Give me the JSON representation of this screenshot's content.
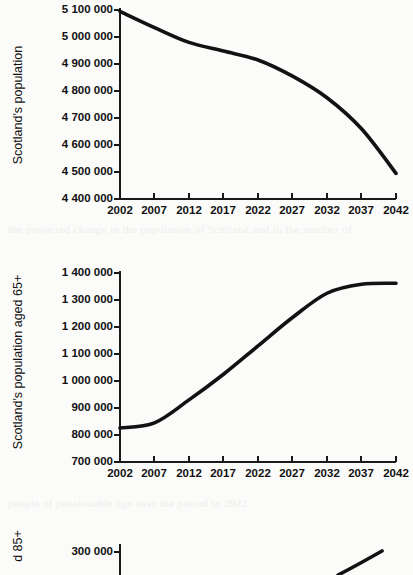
{
  "page": {
    "background_color": "#fbfbfa",
    "ink_color": "#121212",
    "bleed_through_line_1": "the projected change in the population of Scotland and in the number of",
    "bleed_through_line_2": "people of pensionable age over the period to 2042"
  },
  "chart_data": [
    {
      "id": "chart-total-population",
      "type": "line",
      "title": "",
      "xlabel": "",
      "ylabel": "Scotland's population",
      "x": [
        2002,
        2007,
        2012,
        2017,
        2022,
        2027,
        2032,
        2037,
        2042
      ],
      "xtick_labels": [
        "2002",
        "2007",
        "2012",
        "2017",
        "2022",
        "2027",
        "2032",
        "2037",
        "2042"
      ],
      "xlim": [
        2002,
        2042
      ],
      "ytick_labels": [
        "5 100 000",
        "5 000 000",
        "4 900 000",
        "4 800 000",
        "4 700 000",
        "4 600 000",
        "4 500 000",
        "4 400 000"
      ],
      "yticks": [
        5100000,
        5000000,
        4900000,
        4800000,
        4700000,
        4600000,
        4500000,
        4400000
      ],
      "ylim": [
        4400000,
        5100000
      ],
      "grid": false,
      "legend": "none",
      "series": [
        {
          "name": "Scotland's population",
          "values": [
            5095000,
            5035000,
            4980000,
            4948000,
            4915000,
            4855000,
            4775000,
            4660000,
            4495000
          ]
        }
      ]
    },
    {
      "id": "chart-population-65-plus",
      "type": "line",
      "title": "",
      "xlabel": "",
      "ylabel": "Scotland's population aged 65+",
      "x": [
        2002,
        2007,
        2012,
        2017,
        2022,
        2027,
        2032,
        2037,
        2042
      ],
      "xtick_labels": [
        "2002",
        "2007",
        "2012",
        "2017",
        "2022",
        "2027",
        "2032",
        "2037",
        "2042"
      ],
      "xlim": [
        2002,
        2042
      ],
      "ytick_labels": [
        "1 400 000",
        "1 300 000",
        "1 200 000",
        "1 100 000",
        "1 000 000",
        "900 000",
        "800 000",
        "700 000"
      ],
      "yticks": [
        1400000,
        1300000,
        1200000,
        1100000,
        1000000,
        900000,
        800000,
        700000
      ],
      "ylim": [
        700000,
        1400000
      ],
      "grid": false,
      "legend": "none",
      "series": [
        {
          "name": "Scotland's population aged 65+",
          "values": [
            826000,
            845000,
            930000,
            1025000,
            1130000,
            1235000,
            1325000,
            1358000,
            1362000
          ]
        }
      ]
    },
    {
      "id": "chart-population-85-plus",
      "type": "line",
      "title": "",
      "xlabel": "",
      "ylabel": "d 85+",
      "ylabel_full_visible": "d 85+",
      "ytick_labels": [
        "300 000"
      ],
      "yticks": [
        300000
      ],
      "grid": false,
      "legend": "none",
      "cropped": true,
      "series": [
        {
          "name": "Scotland's population aged 85+",
          "values": []
        }
      ]
    }
  ]
}
